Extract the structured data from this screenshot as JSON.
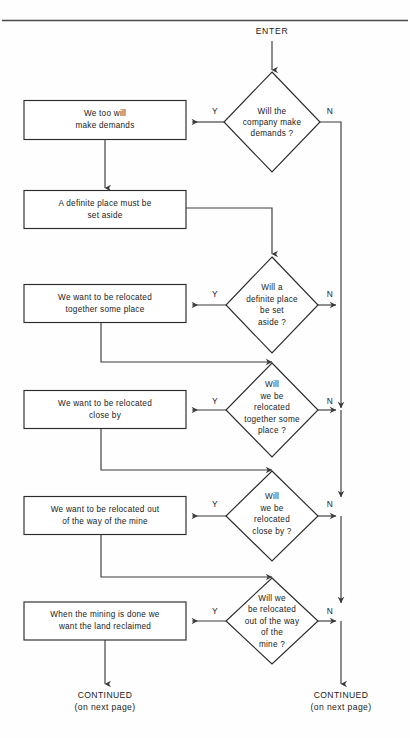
{
  "diagram": {
    "type": "flowchart",
    "title_text": "ENTER",
    "top_rule": true,
    "entry": {
      "label": "ENTER"
    },
    "decisions": [
      {
        "id": "d1",
        "lines": [
          "Will the",
          "company make",
          "demands ?"
        ],
        "yes_label": "Y",
        "no_label": "N",
        "yes_target": "b1",
        "no_target": "continued-right"
      },
      {
        "id": "d2",
        "lines": [
          "Will a",
          "definite place",
          "be set",
          "aside ?"
        ],
        "yes_label": "Y",
        "no_label": "N",
        "yes_target": "b3",
        "no_target": "continued-right"
      },
      {
        "id": "d3",
        "lines": [
          "Will",
          "we be",
          "relocated",
          "together some",
          "place ?"
        ],
        "yes_label": "Y",
        "no_label": "N",
        "yes_target": "b4",
        "no_target": "continued-right"
      },
      {
        "id": "d4",
        "lines": [
          "Will",
          "we be",
          "relocated",
          "close by ?"
        ],
        "yes_label": "Y",
        "no_label": "N",
        "yes_target": "b5",
        "no_target": "continued-right"
      },
      {
        "id": "d5",
        "lines": [
          "Will we",
          "be relocated",
          "out of the way",
          "of the",
          "mine ?"
        ],
        "yes_label": "Y",
        "no_label": "N",
        "yes_target": "b6",
        "no_target": "continued-right"
      }
    ],
    "process_boxes": [
      {
        "id": "b1",
        "lines": [
          "We too will",
          "make demands"
        ]
      },
      {
        "id": "b2",
        "lines": [
          "A definite place must be",
          "set aside"
        ]
      },
      {
        "id": "b3",
        "lines": [
          "We want to be relocated",
          "together some place"
        ]
      },
      {
        "id": "b4",
        "lines": [
          "We want to be relocated",
          "close by"
        ]
      },
      {
        "id": "b5",
        "lines": [
          "We want to be relocated out",
          "of the way of the mine"
        ]
      },
      {
        "id": "b6",
        "lines": [
          "When the mining is done we",
          "want the land reclaimed"
        ]
      }
    ],
    "terminals": [
      {
        "id": "term-left",
        "lines": [
          "CONTINUED",
          "(on next page)"
        ]
      },
      {
        "id": "term-right",
        "lines": [
          "CONTINUED",
          "(on next page)"
        ]
      }
    ],
    "colors": {
      "stroke": "#2b2b2b",
      "connector": "#3a3a3a",
      "text": "#1a1a1a",
      "background": "#fefefe"
    }
  }
}
